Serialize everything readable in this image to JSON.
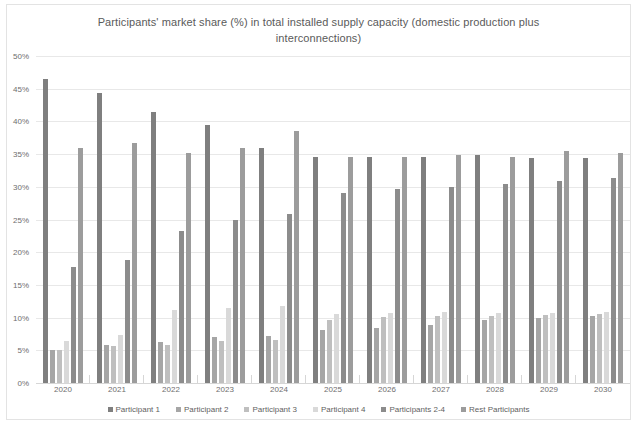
{
  "chart_data": {
    "type": "bar",
    "title": "Participants' market share (%) in total installed supply capacity (domestic production plus interconnections)",
    "xlabel": "",
    "ylabel": "",
    "ylim": [
      0,
      50
    ],
    "ytick_labels": [
      "50%",
      "45%",
      "40%",
      "35%",
      "30%",
      "25%",
      "20%",
      "15%",
      "10%",
      "5%",
      "0%"
    ],
    "ytick_values": [
      50,
      45,
      40,
      35,
      30,
      25,
      20,
      15,
      10,
      5,
      0
    ],
    "grid": true,
    "legend_position": "bottom",
    "categories": [
      "2020",
      "2021",
      "2022",
      "2023",
      "2024",
      "2025",
      "2026",
      "2027",
      "2028",
      "2029",
      "2030"
    ],
    "series": [
      {
        "name": "Participant 1",
        "color": "#7f7f7f",
        "values": [
          46.5,
          44.4,
          41.4,
          39.4,
          35.9,
          34.6,
          34.5,
          34.6,
          34.9,
          34.4,
          34.4
        ]
      },
      {
        "name": "Participant 2",
        "color": "#a6a6a6",
        "values": [
          5.0,
          5.8,
          6.2,
          7.0,
          7.2,
          8.1,
          8.4,
          8.9,
          9.6,
          10.0,
          10.3
        ]
      },
      {
        "name": "Participant 3",
        "color": "#bfbfbf",
        "values": [
          5.1,
          5.6,
          5.8,
          6.5,
          6.6,
          9.7,
          10.1,
          10.3,
          10.2,
          10.4,
          10.6
        ]
      },
      {
        "name": "Participant 4",
        "color": "#d9d9d9",
        "values": [
          6.5,
          7.3,
          11.2,
          11.5,
          11.7,
          10.6,
          10.7,
          10.8,
          10.7,
          10.7,
          10.8
        ]
      },
      {
        "name": "Participants 2-4",
        "color": "#8c8c8c",
        "values": [
          17.7,
          18.8,
          23.3,
          25.0,
          25.8,
          29.0,
          29.6,
          29.9,
          30.5,
          30.9,
          31.3
        ]
      },
      {
        "name": "Rest Participants",
        "color": "#9c9c9c",
        "values": [
          36.0,
          36.7,
          35.2,
          35.9,
          38.6,
          34.5,
          34.5,
          34.9,
          34.5,
          35.4,
          35.1
        ]
      }
    ]
  },
  "footnote": ""
}
